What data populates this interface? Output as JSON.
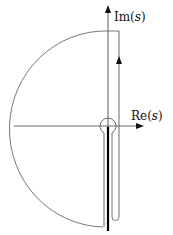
{
  "diagram": {
    "type": "contour-integration",
    "axes": {
      "imaginary": {
        "label_prefix": "Im(",
        "label_var": "s",
        "label_suffix": ")"
      },
      "real": {
        "label_prefix": "Re(",
        "label_var": "s",
        "label_suffix": ")"
      }
    },
    "elements": [
      "large-arc-left-half",
      "vertical-contour-line-with-upward-arrow",
      "small-circle-around-origin",
      "keyhole-along-branch-cut",
      "branch-cut-thick-line"
    ],
    "colors": {
      "stroke": "#333333",
      "axis": "#222222",
      "branch_cut": "#000000",
      "background": "#ffffff"
    }
  }
}
